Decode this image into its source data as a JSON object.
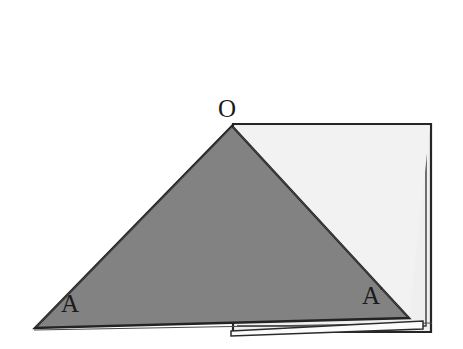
{
  "figure": {
    "background_color": "#ffffff",
    "colors": {
      "dark_fill": "#808080",
      "light_fill": "#efefef",
      "outline": "#1a1a1a",
      "label_color": "#1a1a1a",
      "sliver_fill": "#fbfbfb"
    },
    "labels": {
      "apex": "O",
      "bottom_left": "A",
      "bottom_right": "A",
      "bottom_right_superscript": "′"
    },
    "shapes": {
      "rectangle": {
        "name": "outer-rectangle",
        "points": "233,125 430,125 430,331 233,331"
      },
      "rectangle_inner": {
        "name": "inner-rectangle-offset",
        "points": "236,128 427,128 427,327 236,327"
      },
      "dark_triangle": {
        "name": "shaded-triangle-OAA",
        "points": "232,127 408,318 36,328"
      },
      "light_triangle": {
        "name": "light-triangle-region",
        "points": "233,126 430,126 410,318"
      },
      "sliver": {
        "name": "thin-wedge-sliver",
        "points": "232,330 421,322 421,328 232,334"
      },
      "baseline": {
        "name": "baseline-segment",
        "x1": 36,
        "y1": 329,
        "x2": 430,
        "y2": 322
      }
    }
  }
}
